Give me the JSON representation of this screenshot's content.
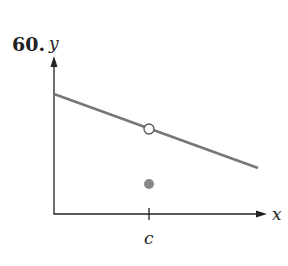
{
  "problem_number": "60.",
  "axes": {
    "x_label": "x",
    "y_label": "y",
    "tick_label": "c"
  },
  "colors": {
    "line": "#777777",
    "axis": "#222222",
    "point": "#888888"
  },
  "graph": {
    "line": {
      "description": "decreasing straight line with hole at x = c"
    },
    "open_point": {
      "x": "c",
      "description": "hole on the line"
    },
    "filled_point": {
      "x": "c",
      "description": "function value below the line"
    }
  }
}
